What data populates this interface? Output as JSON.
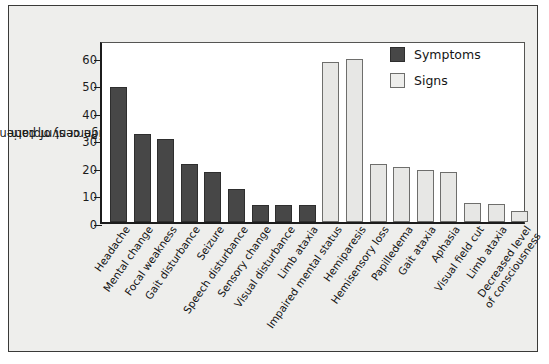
{
  "chart_data": {
    "type": "bar",
    "title": "",
    "xlabel": "",
    "ylabel": "Percent of patients with sign or symptom",
    "ylabel_line1": "Percent of patients with",
    "ylabel_line2": "sign or symptom",
    "ylim": [
      0,
      66
    ],
    "yticks": [
      0,
      10,
      20,
      30,
      40,
      50,
      60
    ],
    "ytick_labels": [
      "0",
      "10",
      "20",
      "30",
      "40",
      "50",
      "60"
    ],
    "grid": false,
    "legend_position": "top-right",
    "legend": [
      {
        "name": "Symptoms",
        "color": "#474747"
      },
      {
        "name": "Signs",
        "color": "#eeeeec"
      }
    ],
    "categories": [
      "Headache",
      "Mental change",
      "Focal weakness",
      "Gait disturbance",
      "Seizure",
      "Speech disturbance",
      "Sensory change",
      "Visual disturbance",
      "Limb ataxia",
      "Impaired mental status",
      "Hemiparesis",
      "Hemisensory loss",
      "Papilledema",
      "Gait ataxia",
      "Aphasia",
      "Visual field cut",
      "Limb ataxia",
      "Decreased level of consciousness"
    ],
    "values": [
      49,
      32,
      30,
      21,
      18,
      12,
      6,
      6,
      6,
      58,
      59,
      21,
      20,
      19,
      18,
      7,
      6.5,
      4
    ],
    "groups": [
      "Symptoms",
      "Symptoms",
      "Symptoms",
      "Symptoms",
      "Symptoms",
      "Symptoms",
      "Symptoms",
      "Symptoms",
      "Symptoms",
      "Signs",
      "Signs",
      "Signs",
      "Signs",
      "Signs",
      "Signs",
      "Signs",
      "Signs",
      "Signs"
    ]
  }
}
